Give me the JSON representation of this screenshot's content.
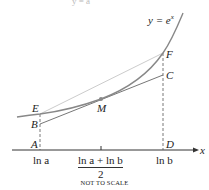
{
  "diagram": {
    "curve_label": "y = e",
    "curve_label_sup": "x",
    "points": {
      "A": "A",
      "B": "B",
      "C": "C",
      "D": "D",
      "E": "E",
      "F": "F",
      "M": "M"
    },
    "axis_label": "x",
    "ticks": {
      "ln_a": "ln a",
      "mid_num": "ln a + ln b",
      "mid_den": "2",
      "ln_b": "ln b"
    },
    "note": "NOT TO SCALE",
    "top_fragment": "y = a",
    "colors": {
      "curve": "#888888",
      "tangent": "#666666",
      "secant": "#cccccc",
      "axis": "#333333"
    }
  }
}
